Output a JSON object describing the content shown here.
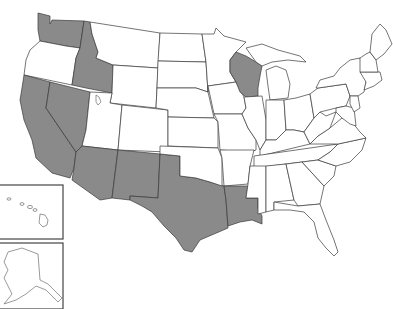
{
  "map": {
    "title": "United States map with highlighted states",
    "highlight_color": "#8a8a8a",
    "base_color": "#ffffff",
    "border_color": "#3a3a3a",
    "highlighted_states": [
      "Washington",
      "Idaho",
      "California",
      "Nevada",
      "Arizona",
      "New Mexico",
      "Texas",
      "Louisiana",
      "Wisconsin"
    ],
    "insets": [
      "Hawaii",
      "Alaska"
    ]
  }
}
